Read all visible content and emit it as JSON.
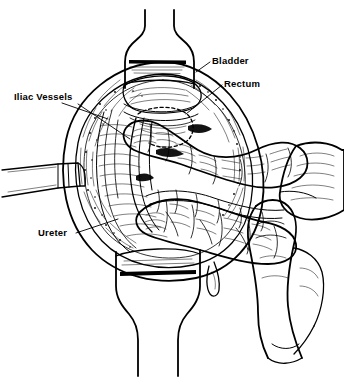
{
  "figure": {
    "kind": "medical-line-illustration",
    "background_color": "#ffffff",
    "ink_color": "#000000",
    "width": 344,
    "height": 384
  },
  "labels": [
    {
      "id": "bladder",
      "text": "Bladder",
      "x": 212,
      "y": 64,
      "anchor": "start",
      "leader": "M 210 62 L 196 72"
    },
    {
      "id": "rectum",
      "text": "Rectum",
      "x": 224,
      "y": 87,
      "anchor": "start",
      "leader": "M 222 85 L 186 114"
    },
    {
      "id": "iliac-vessels",
      "text": "Iliac Vessels",
      "x": 14,
      "y": 100,
      "anchor": "start",
      "leader": "M 62 103 L 108 119 M 78 104 L 130 139"
    },
    {
      "id": "ureter",
      "text": "Ureter",
      "x": 38,
      "y": 236,
      "anchor": "start",
      "leader": "M 76 233 L 118 219"
    }
  ],
  "structures": [
    {
      "id": "torso-upper",
      "name": "Upper torso / abdominal wall above wound"
    },
    {
      "id": "torso-lower",
      "name": "Lower torso / thigh below wound"
    },
    {
      "id": "wound-opening",
      "name": "Oval surgical wound opening"
    },
    {
      "id": "cut-edge",
      "name": "Hatched incised tissue edge"
    },
    {
      "id": "retractor-blade",
      "name": "Retractor blade at left wound margin"
    },
    {
      "id": "bladder-dome",
      "name": "Bladder dome"
    },
    {
      "id": "rectum-outline",
      "name": "Dashed rectum boundary"
    },
    {
      "id": "bowel-loop-major",
      "name": "Large mobilized bowel loop"
    },
    {
      "id": "bowel-loops-lower",
      "name": "Lower bowel loops"
    },
    {
      "id": "mesentery-vessels",
      "name": "Mesenteric vessel arcade"
    },
    {
      "id": "surgeon-hand",
      "name": "Surgeon's hand and fingers entering from right"
    },
    {
      "id": "drape-bar-upper",
      "name": "Upper drape edge bar"
    },
    {
      "id": "drape-bar-lower",
      "name": "Lower drape edge bar"
    }
  ]
}
